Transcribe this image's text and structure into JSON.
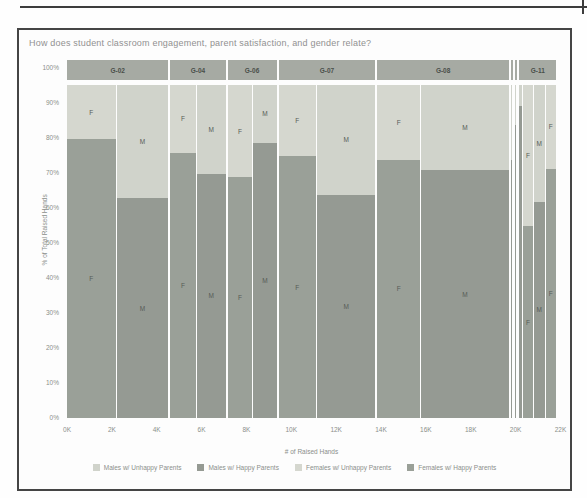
{
  "title": "How does student classroom engagement, parent satisfaction, and gender relate?",
  "chart_data": {
    "type": "bar",
    "variant": "marimekko",
    "title": "How does student classroom engagement, parent satisfaction, and gender relate?",
    "xlabel": "# of Raised Hands",
    "ylabel": "% of Total Raised Hands",
    "x_axis_unit": "K",
    "x_ticks": [
      {
        "k": 0,
        "label": "0K"
      },
      {
        "k": 2,
        "label": "2K"
      },
      {
        "k": 4,
        "label": "4K"
      },
      {
        "k": 6,
        "label": "6K"
      },
      {
        "k": 8,
        "label": "8K"
      },
      {
        "k": 10,
        "label": "10K"
      },
      {
        "k": 12,
        "label": "12K"
      },
      {
        "k": 14,
        "label": "14K"
      },
      {
        "k": 16,
        "label": "16K"
      },
      {
        "k": 18,
        "label": "18K"
      },
      {
        "k": 20,
        "label": "20K"
      },
      {
        "k": 22,
        "label": "22K"
      }
    ],
    "y_ticks": [
      {
        "v": 100,
        "label": "100%"
      },
      {
        "v": 90,
        "label": "90%"
      },
      {
        "v": 80,
        "label": "80%"
      },
      {
        "v": 70,
        "label": "70%"
      },
      {
        "v": 60,
        "label": "60%"
      },
      {
        "v": 50,
        "label": "50%"
      },
      {
        "v": 40,
        "label": "40%"
      },
      {
        "v": 30,
        "label": "30%"
      },
      {
        "v": 20,
        "label": "20%"
      },
      {
        "v": 10,
        "label": "10%"
      },
      {
        "v": 0,
        "label": "0%"
      }
    ],
    "bar_top_pct": 95.5,
    "groups": [
      {
        "label": "G-02",
        "bars": [
          {
            "gender": "F",
            "width_k": 2.4,
            "happy_pct": 80,
            "show_labels": true
          },
          {
            "gender": "M",
            "width_k": 2.5,
            "happy_pct": 63,
            "show_labels": true
          }
        ]
      },
      {
        "label": "G-04",
        "bars": [
          {
            "gender": "F",
            "width_k": 1.1,
            "happy_pct": 76,
            "show_labels": true
          },
          {
            "gender": "M",
            "width_k": 1.2,
            "happy_pct": 70,
            "show_labels": true
          }
        ]
      },
      {
        "label": "G-06",
        "bars": [
          {
            "gender": "F",
            "width_k": 1.05,
            "happy_pct": 69,
            "show_labels": true
          },
          {
            "gender": "M",
            "width_k": 0.9,
            "happy_pct": 79,
            "show_labels": true
          }
        ]
      },
      {
        "label": "G-07",
        "bars": [
          {
            "gender": "F",
            "width_k": 1.8,
            "happy_pct": 75,
            "show_labels": true
          },
          {
            "gender": "M",
            "width_k": 2.85,
            "happy_pct": 64,
            "show_labels": true
          }
        ]
      },
      {
        "label": "G-08",
        "bars": [
          {
            "gender": "F",
            "width_k": 2.1,
            "happy_pct": 74,
            "show_labels": true
          },
          {
            "gender": "M",
            "width_k": 4.5,
            "happy_pct": 71,
            "show_labels": true
          }
        ]
      },
      {
        "label": "",
        "bars": [
          {
            "gender": "",
            "width_k": 0.13,
            "happy_pct": 74,
            "show_labels": false
          }
        ]
      },
      {
        "label": "",
        "bars": [
          {
            "gender": "",
            "width_k": 0.13,
            "happy_pct": 84,
            "show_labels": false
          }
        ]
      },
      {
        "label": "G-11",
        "bars": [
          {
            "gender": "",
            "width_k": 0.16,
            "happy_pct": 89.5,
            "show_labels": false
          },
          {
            "gender": "F",
            "width_k": 0.31,
            "happy_pct": 55,
            "show_labels": true
          },
          {
            "gender": "M",
            "width_k": 0.31,
            "happy_pct": 62,
            "show_labels": true
          },
          {
            "gender": "F",
            "width_k": 0.36,
            "happy_pct": 71.5,
            "show_labels": true
          }
        ]
      }
    ],
    "legend": [
      {
        "label": "Males w/ Unhappy Parents",
        "color": "#d0d3cb"
      },
      {
        "label": "Males w/ Happy Parents",
        "color": "#959a93"
      },
      {
        "label": "Females w/ Unhappy Parents",
        "color": "#d5d7cf"
      },
      {
        "label": "Females w/ Happy Parents",
        "color": "#9aa098"
      }
    ],
    "colors": {
      "male_happy": "#959a93",
      "male_unhappy": "#d0d3cb",
      "female_happy": "#9aa098",
      "female_unhappy": "#d5d7cf",
      "band": "#a6aaa3",
      "band_text": "#4a4f4a",
      "gender_label_text": "#575c57"
    },
    "layout": {
      "legend_position": "bottom",
      "grid": false,
      "header_band": true
    }
  }
}
